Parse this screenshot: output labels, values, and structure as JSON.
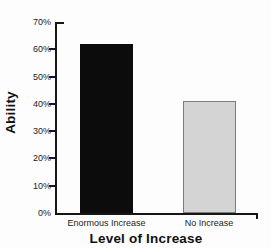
{
  "chart_data": {
    "type": "bar",
    "categories": [
      "Enormous Increase",
      "No Increase"
    ],
    "values": [
      62,
      41
    ],
    "title": "",
    "xlabel": "Level of Increase",
    "ylabel": "Ability",
    "ylim": [
      0,
      70
    ],
    "ytick_step": 10,
    "yticks": [
      "0%",
      "10%",
      "20%",
      "30%",
      "40%",
      "50%",
      "60%",
      "70%"
    ],
    "grid": false,
    "legend": "none",
    "colors": {
      "bar_fills": [
        "#0c0c0c",
        "#d4d4d4"
      ],
      "bar_borders": [
        "#0c0c0c",
        "#7b7b7b"
      ],
      "axis": "#161616",
      "text": "#1c1c1c",
      "background": "#fdfdfd"
    }
  }
}
